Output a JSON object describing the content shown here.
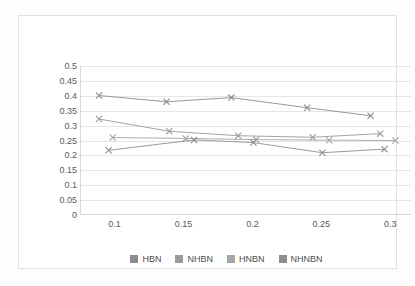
{
  "chart_data": {
    "type": "line",
    "title": "",
    "subtitle": "",
    "xlabel": "",
    "ylabel": "",
    "xlim": [
      0.075,
      0.315
    ],
    "ylim": [
      0,
      0.5
    ],
    "grid": true,
    "legend_position": "bottom",
    "marker": "x",
    "y_ticks": [
      "0",
      "0.05",
      "0.1",
      "0.15",
      "0.2",
      "0.25",
      "0.3",
      "0.35",
      "0.4",
      "0.45",
      "0.5"
    ],
    "y_tick_values": [
      0,
      0.05,
      0.1,
      0.15,
      0.2,
      0.25,
      0.3,
      0.35,
      0.4,
      0.45,
      0.5
    ],
    "x_ticks": [
      "0.1",
      "0.15",
      "0.2",
      "0.25",
      "0.3"
    ],
    "x_tick_values": [
      0.1,
      0.15,
      0.2,
      0.25,
      0.3
    ],
    "series": [
      {
        "name": "HBN",
        "color": "#8c8c8c",
        "x": [
          0.088,
          0.137,
          0.184,
          0.239,
          0.285
        ],
        "values": [
          0.401,
          0.38,
          0.394,
          0.36,
          0.333
        ]
      },
      {
        "name": "NHBN",
        "color": "#9a9a9a",
        "x": [
          0.088,
          0.139,
          0.189,
          0.243,
          0.292
        ],
        "values": [
          0.322,
          0.281,
          0.266,
          0.261,
          0.273
        ]
      },
      {
        "name": "HNBN",
        "color": "#a5a5a5",
        "x": [
          0.098,
          0.151,
          0.202,
          0.255,
          0.303
        ],
        "values": [
          0.26,
          0.257,
          0.253,
          0.251,
          0.25
        ]
      },
      {
        "name": "NHNBN",
        "color": "#8f8f8f",
        "x": [
          0.095,
          0.157,
          0.2,
          0.25,
          0.295
        ],
        "values": [
          0.217,
          0.252,
          0.243,
          0.209,
          0.221
        ]
      }
    ]
  },
  "legend": {
    "items": [
      {
        "label": "HBN",
        "color": "#8c8c8c"
      },
      {
        "label": "NHBN",
        "color": "#9a9a9a"
      },
      {
        "label": "HNBN",
        "color": "#a5a5a5"
      },
      {
        "label": "NHNBN",
        "color": "#8f8f8f"
      }
    ]
  }
}
